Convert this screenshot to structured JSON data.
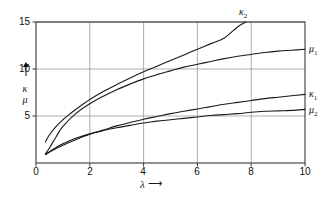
{
  "figure": {
    "background": "#ffffff",
    "line_color": "#1a1a1a",
    "grid_color": "#8c8c8c",
    "frame_color": "#3a3a3a"
  },
  "axes": {
    "y_label_top": "κ",
    "y_label_bottom": "μ",
    "y_arrow": "↑",
    "x_label": "λ",
    "x_arrow": "⟶",
    "y_ticks": [
      "15",
      "10",
      "5"
    ],
    "x_ticks": [
      "0",
      "2",
      "4",
      "6",
      "8",
      "10"
    ]
  },
  "curve_labels": {
    "kappa2": "κ",
    "kappa2_sub": "2",
    "mu1": "μ",
    "mu1_sub": "1",
    "kappa1": "κ",
    "kappa1_sub": "1",
    "mu2": "μ",
    "mu2_sub": "2"
  },
  "chart_data": {
    "type": "line",
    "title": "",
    "xlabel": "λ",
    "ylabel": "κ, μ",
    "xlim": [
      0,
      10
    ],
    "ylim": [
      0,
      15
    ],
    "grid": true,
    "xticks": [
      0,
      2,
      4,
      6,
      8,
      10
    ],
    "yticks": [
      0,
      5,
      10,
      15
    ],
    "legend_position": "inline-right",
    "annotations": [
      {
        "text": "κ₂",
        "x": 7.5,
        "y": 15.6
      },
      {
        "text": "μ₁",
        "x": 10.3,
        "y": 12.3
      },
      {
        "text": "κ₁",
        "x": 10.3,
        "y": 7.4
      },
      {
        "text": "μ₂",
        "x": 10.3,
        "y": 5.8
      }
    ],
    "series": [
      {
        "name": "κ₂",
        "x": [
          0.35,
          0.5,
          0.75,
          1.0,
          1.25,
          1.5,
          2.0,
          2.5,
          3.0,
          3.5,
          4.0,
          4.5,
          5.0,
          5.5,
          6.0,
          6.5,
          7.0,
          7.5,
          7.8
        ],
        "y": [
          2.25,
          3.0,
          3.9,
          4.6,
          5.2,
          5.75,
          6.75,
          7.6,
          8.35,
          9.05,
          9.7,
          10.3,
          10.9,
          11.5,
          12.1,
          12.7,
          13.3,
          14.5,
          15.0
        ]
      },
      {
        "name": "μ₁",
        "x": [
          0.35,
          0.5,
          0.75,
          1.0,
          1.5,
          2.0,
          2.5,
          3.0,
          3.5,
          4.0,
          4.5,
          5.0,
          5.5,
          6.0,
          6.5,
          7.0,
          7.5,
          8.0,
          8.5,
          9.0,
          9.5,
          10.0
        ],
        "y": [
          0.95,
          1.6,
          2.8,
          3.9,
          5.3,
          6.3,
          7.1,
          7.8,
          8.4,
          8.95,
          9.4,
          9.8,
          10.2,
          10.5,
          10.8,
          11.1,
          11.35,
          11.55,
          11.75,
          11.9,
          12.0,
          12.1
        ]
      },
      {
        "name": "κ₁",
        "x": [
          0.35,
          0.5,
          0.75,
          1.0,
          1.5,
          2.0,
          2.5,
          3.0,
          3.5,
          4.0,
          4.5,
          5.0,
          5.5,
          6.0,
          6.5,
          7.0,
          7.5,
          8.0,
          8.5,
          9.0,
          9.5,
          10.0
        ],
        "y": [
          0.9,
          1.15,
          1.55,
          1.9,
          2.5,
          3.05,
          3.5,
          3.95,
          4.3,
          4.65,
          4.95,
          5.25,
          5.5,
          5.75,
          6.0,
          6.25,
          6.45,
          6.65,
          6.85,
          7.0,
          7.15,
          7.3
        ]
      },
      {
        "name": "μ₂",
        "x": [
          0.35,
          0.5,
          0.75,
          1.0,
          1.5,
          2.0,
          2.5,
          3.0,
          3.5,
          4.0,
          4.5,
          5.0,
          5.5,
          6.0,
          6.5,
          7.0,
          7.5,
          8.0,
          8.5,
          9.0,
          9.5,
          10.0
        ],
        "y": [
          0.9,
          1.2,
          1.65,
          2.05,
          2.65,
          3.1,
          3.45,
          3.75,
          4.0,
          4.25,
          4.45,
          4.6,
          4.75,
          4.9,
          5.05,
          5.15,
          5.25,
          5.4,
          5.5,
          5.55,
          5.6,
          5.7
        ]
      }
    ]
  }
}
